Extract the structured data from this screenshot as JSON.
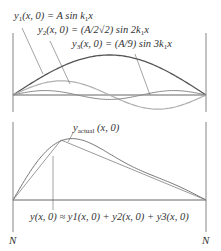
{
  "figure": {
    "top_panel": {
      "labels": {
        "y1": {
          "lhs": "y",
          "sub": "1",
          "args": "(x, 0) = A sin k",
          "ksub": "1",
          "tail": "x"
        },
        "y2": {
          "lhs": "y",
          "sub": "2",
          "args": "(x, 0) = (A/2√2) sin 2k",
          "ksub": "1",
          "tail": "x"
        },
        "y3": {
          "lhs": "y",
          "sub": "3",
          "args": "(x, 0) = (A/9) sin 3k",
          "ksub": "1",
          "tail": "x"
        }
      },
      "label_texts": [
        "y1(x, 0) = A sin k1x",
        "y2(x, 0) = (A/2√2) sin 2k1x",
        "y3(x, 0) = (A/9) sin 3k1x"
      ]
    },
    "bottom_panel": {
      "actual_label": {
        "lhs": "y",
        "sub": "actual",
        "args": " (x, 0)"
      },
      "sum_label": "y(x, 0) ≈ y1(x, 0) + y2(x, 0) + y3(x, 0)",
      "node_left": "N",
      "node_right": "N"
    },
    "colors": {
      "y1": "#555555",
      "y2": "#b0b0b0",
      "y3": "#8a8a8a",
      "axis": "#555555",
      "actual": "#999999",
      "sum": "#777777"
    }
  },
  "chart_data": {
    "type": "line",
    "panels": [
      {
        "name": "harmonic components",
        "x_range": [
          0,
          1
        ],
        "series": [
          {
            "name": "y1(x,0) = A sin k1x",
            "amplitude": 1.0,
            "harmonic": 1
          },
          {
            "name": "y2(x,0) = (A/2√2) sin 2k1x",
            "amplitude": 0.354,
            "harmonic": 2
          },
          {
            "name": "y3(x,0) = (A/9) sin 3k1x",
            "amplitude": 0.111,
            "harmonic": 3
          }
        ]
      },
      {
        "name": "superposition",
        "series": [
          {
            "name": "y_actual(x,0)",
            "shape": "triangle",
            "peak_x": 0.25
          },
          {
            "name": "y(x,0) ≈ y1 + y2 + y3",
            "shape": "smooth approximation"
          }
        ],
        "endpoints": [
          "N",
          "N"
        ]
      }
    ]
  }
}
